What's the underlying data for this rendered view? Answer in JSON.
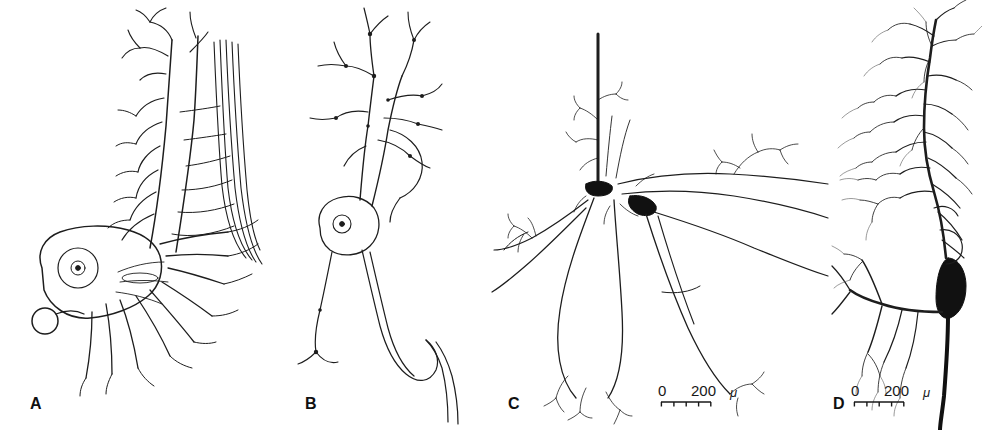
{
  "figure": {
    "background_color": "#ffffff",
    "ink_color": "#1a1a1a",
    "width": 982,
    "height": 430
  },
  "panels": [
    {
      "id": "A",
      "label": "A",
      "label_x": 30,
      "label_y": 396,
      "art_name": "neuron-drawing-a",
      "description": "Large multipolar neuron with pale outlined soma containing a nucleus, dense radiating dendrites and a thick ascending dendritic trunk with fascicle of parallel fibers"
    },
    {
      "id": "B",
      "label": "B",
      "label_x": 305,
      "label_y": 396,
      "art_name": "neuron-drawing-b",
      "description": "Small fusiform neuron with outlined soma and nucleus, beaded ascending dendrites and a descending axon"
    },
    {
      "id": "C",
      "label": "C",
      "label_x": 508,
      "label_y": 396,
      "art_name": "neuron-drawing-c",
      "description": "Neuron with dark filled soma, thick vertical apical process and wide horizontal dendrites bearing spiny terminal tufts"
    },
    {
      "id": "D",
      "label": "D",
      "label_x": 833,
      "label_y": 396,
      "art_name": "neuron-drawing-d",
      "description": "Neuron with dark elongated teardrop soma at right, thick descending axon and extensive fine dendritic arbor to the left"
    }
  ],
  "scale_bars": [
    {
      "name": "scale-bar-c",
      "zero_label": "0",
      "value_label": "200",
      "unit_label": "μ",
      "x": 658,
      "y": 383,
      "divisions": 4
    },
    {
      "name": "scale-bar-d",
      "zero_label": "0",
      "value_label": "200",
      "unit_label": "μ",
      "x": 851,
      "y": 383,
      "divisions": 4
    }
  ]
}
